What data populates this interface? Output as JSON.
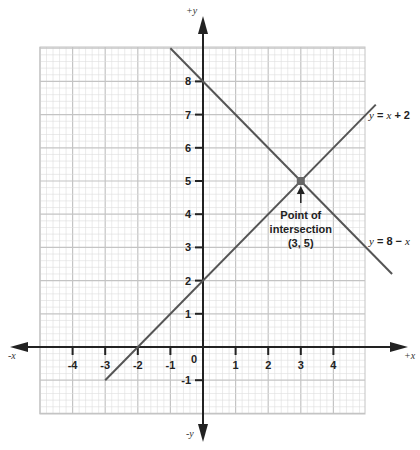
{
  "chart_data": {
    "type": "line",
    "title": "",
    "xlabel": "+x",
    "xlabel_neg": "-x",
    "ylabel": "+y",
    "ylabel_neg": "-y",
    "xlim": [
      -5,
      5
    ],
    "ylim": [
      -2,
      9
    ],
    "grid": true,
    "x_ticks": [
      -4,
      -3,
      -2,
      -1,
      0,
      1,
      2,
      3,
      4
    ],
    "y_ticks": [
      -1,
      1,
      2,
      3,
      4,
      5,
      6,
      7,
      8
    ],
    "series": [
      {
        "name": "y = x + 2",
        "label_parts": [
          "y",
          " = ",
          "x",
          " + 2"
        ],
        "points": [
          [
            -3,
            -1
          ],
          [
            5.3,
            7.3
          ]
        ],
        "color": "#555555"
      },
      {
        "name": "y = 8 − x",
        "label_parts": [
          "y",
          " = 8 − ",
          "x",
          ""
        ],
        "points": [
          [
            -1,
            9
          ],
          [
            5.8,
            2.2
          ]
        ],
        "color": "#555555"
      }
    ],
    "annotations": [
      {
        "text_lines": [
          "Point of",
          "intersection",
          "(3, 5)"
        ],
        "point": [
          3,
          5
        ]
      }
    ]
  },
  "colors": {
    "axis": "#222222",
    "grid_minor": "#dddddd",
    "grid_major": "#c4c4c4",
    "line": "#555555",
    "marker": "#666666"
  }
}
